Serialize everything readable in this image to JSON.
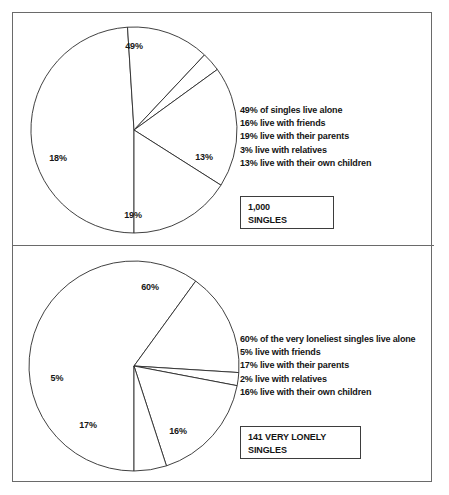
{
  "figure": {
    "title_visible": false,
    "background_color": "#ffffff",
    "frame_color": "#6a6a6a",
    "slice_stroke_color": "#2b2b2b"
  },
  "panels": [
    {
      "name": "singles-panel",
      "count_box": {
        "line1": "1,000",
        "line2": "SINGLES"
      },
      "legend": [
        "49% of singles live alone",
        "16% live with friends",
        "19% live with their parents",
        "3% live with relatives",
        "13% live with their own children"
      ],
      "labels": [
        "49%",
        "13%",
        "19%",
        "18%"
      ]
    },
    {
      "name": "very-lonely-singles-panel",
      "count_box": {
        "line1": "141 VERY LONELY",
        "line2": "SINGLES"
      },
      "legend": [
        "60% of the very loneliest singles live alone",
        "5% live with friends",
        "17% live with their parents",
        "2% live with relatives",
        "16% live with their own children"
      ],
      "labels": [
        "60%",
        "16%",
        "17%",
        "5%"
      ]
    }
  ],
  "chart_data": [
    {
      "type": "pie",
      "title": "1,000 SINGLES",
      "categories": [
        "live alone",
        "live with their own children",
        "live with relatives",
        "live with their parents",
        "live with friends"
      ],
      "values": [
        49,
        13,
        3,
        19,
        16
      ],
      "value_labels": [
        "49%",
        "13%",
        "3%",
        "19%",
        "18%"
      ],
      "units": "percent",
      "start_angle_deg": 180,
      "direction": "clockwise",
      "legend_position": "right",
      "legend_entries": [
        "49% of singles live alone",
        "16% live with friends",
        "19% live with their parents",
        "3% live with relatives",
        "13% live with their own children"
      ],
      "note": "The 16%-friends wedge is drawn as the left 18% labelled sector",
      "n": 1000
    },
    {
      "type": "pie",
      "title": "141 VERY LONELY SINGLES",
      "categories": [
        "live alone",
        "live with their own children",
        "live with relatives",
        "live with their parents",
        "live with friends"
      ],
      "values": [
        60,
        16,
        2,
        17,
        5
      ],
      "value_labels": [
        "60%",
        "16%",
        "2%",
        "17%",
        "5%"
      ],
      "units": "percent",
      "start_angle_deg": 180,
      "direction": "clockwise",
      "legend_position": "right",
      "legend_entries": [
        "60% of the very loneliest singles live alone",
        "5% live with friends",
        "17% live with their parents",
        "2% live with relatives",
        "16% live with their own children"
      ],
      "n": 141
    }
  ]
}
